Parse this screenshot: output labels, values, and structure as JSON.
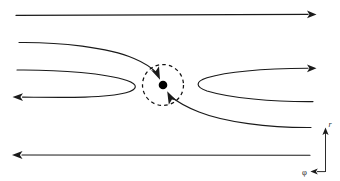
{
  "figure": {
    "background_color": "#ffffff",
    "stroke_color": "#1a1a1a",
    "dash_color": "#111111",
    "dot_color": "#000000",
    "axis_color": "#2b2b2b"
  },
  "center_marker": {
    "name": "central point",
    "cx": 163,
    "cy": 85,
    "dot_radius": 4.2,
    "circle_radius": 20.5,
    "circle_style": "dashed"
  },
  "axes": {
    "radial_label": "r",
    "azimuthal_label": "φ",
    "radial_direction": "up",
    "azimuthal_direction": "left",
    "origin_x": 325,
    "origin_y": 156
  },
  "streamlines": [
    {
      "id": "top-straight",
      "label": "top straight streamline",
      "direction": "right",
      "y": 15,
      "x_start": 16,
      "x_end": 314,
      "shape": "straight"
    },
    {
      "id": "upper-left-inflow",
      "label": "upper-left inflow branch into circle",
      "direction": "into-circle",
      "shape": "curved",
      "arrow_at": "circle-upper-left"
    },
    {
      "id": "left-hairpin",
      "label": "left hairpin streamline",
      "direction": "left",
      "inbound_y": 70,
      "outbound_y": 97,
      "turn_x": 130,
      "shape": "hairpin"
    },
    {
      "id": "right-hairpin",
      "label": "right hairpin streamline",
      "direction": "right",
      "inbound_y": 101,
      "outbound_y": 68,
      "turn_x": 196,
      "shape": "hairpin"
    },
    {
      "id": "lower-right-inflow",
      "label": "lower-right inflow branch into circle",
      "direction": "into-circle",
      "shape": "curved",
      "arrow_at": "circle-lower-right"
    },
    {
      "id": "bottom-straight",
      "label": "bottom straight streamline",
      "direction": "left",
      "y": 155,
      "x_start": 310,
      "x_end": 13,
      "shape": "straight"
    }
  ]
}
